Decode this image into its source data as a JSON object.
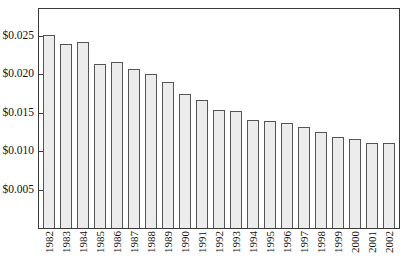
{
  "chart_data": {
    "type": "bar",
    "title": "",
    "xlabel": "",
    "ylabel": "",
    "ylim": [
      0,
      0.0285
    ],
    "grid": false,
    "legend": "none",
    "y_tick_values": [
      0.005,
      0.01,
      0.015,
      0.02,
      0.025
    ],
    "y_tick_labels": [
      "$0.005",
      "$0.010",
      "$0.015",
      "$0.020",
      "$0.025"
    ],
    "categories": [
      "1982",
      "1983",
      "1984",
      "1985",
      "1986",
      "1987",
      "1988",
      "1989",
      "1990",
      "1991",
      "1992",
      "1993",
      "1994",
      "1995",
      "1996",
      "1997",
      "1998",
      "1999",
      "2000",
      "2001",
      "2002"
    ],
    "values": [
      0.0251,
      0.0239,
      0.0242,
      0.0214,
      0.0216,
      0.0207,
      0.02,
      0.019,
      0.0174,
      0.0167,
      0.0153,
      0.0152,
      0.0141,
      0.0139,
      0.0137,
      0.0131,
      0.0125,
      0.0119,
      0.0116,
      0.011,
      0.011
    ],
    "bar_fill_color": "#ececec",
    "bar_border_color": "#555555",
    "frame_color": "#3a3a3a",
    "background_color": "#ffffff"
  }
}
